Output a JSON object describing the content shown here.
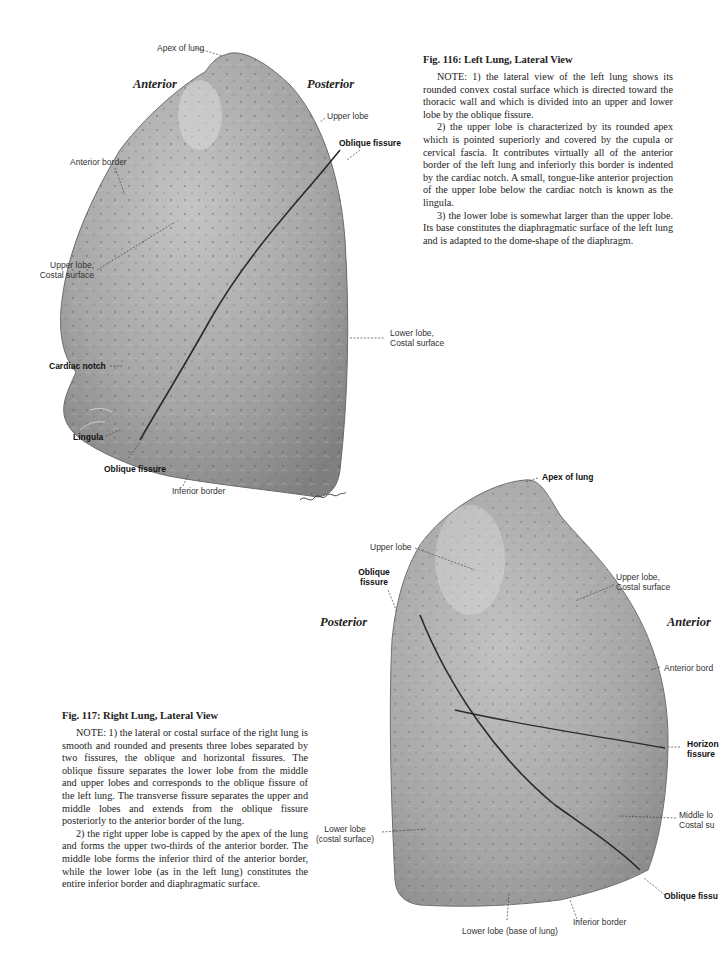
{
  "figure_116": {
    "title": "Fig. 116: Left Lung, Lateral View",
    "paragraphs": [
      "NOTE: 1) the lateral view of the left lung shows its rounded convex costal surface which is directed toward the thoracic wall and which is divided into an upper and lower lobe by the oblique fissure.",
      "2) the upper lobe is characterized by its rounded apex which is pointed superiorly and covered by the cupula or cervical fascia. It contributes virtually all of the anterior border of the left lung and inferiorly this border is indented by the cardiac notch. A small, tongue-like anterior projection of the upper lobe below the cardiac notch is known as the lingula.",
      "3) the lower lobe is somewhat larger than the upper lobe. Its base constitutes the diaphragmatic surface of the left lung and is adapted to the dome-shape of the diaphragm."
    ],
    "directions": {
      "anterior": "Anterior",
      "posterior": "Posterior"
    },
    "labels": {
      "apex": "Apex of lung",
      "upper_lobe": "Upper lobe",
      "oblique_fissure_top": "Oblique fissure",
      "anterior_border": "Anterior border",
      "upper_lobe_costal_1": "Upper lobe,",
      "upper_lobe_costal_2": "Costal surface",
      "lower_lobe_costal_1": "Lower lobe,",
      "lower_lobe_costal_2": "Costal surface",
      "cardiac_notch": "Cardiac notch",
      "lingula": "Lingula",
      "oblique_fissure_bottom": "Oblique fissure",
      "inferior_border": "Inferior border"
    },
    "signature": "Lipniers"
  },
  "figure_117": {
    "title": "Fig. 117: Right Lung, Lateral View",
    "paragraphs": [
      "NOTE: 1) the lateral or costal surface of the right lung is smooth and rounded and presents three lobes separated by two fissures, the oblique and horizontal fissures. The oblique fissure separates the lower lobe from the middle and upper lobes and corresponds to the oblique fissure of the left lung. The transverse fissure separates the upper and middle lobes and extends from the oblique fissure posteriorly to the anterior border of the lung.",
      "2) the right upper lobe is capped by the apex of the lung and forms the upper two-thirds of the anterior border. The middle lobe forms the inferior third of the anterior border, while the lower lobe (as in the left lung) constitutes the entire inferior border and diaphragmatic surface."
    ],
    "directions": {
      "posterior": "Posterior",
      "anterior": "Anterior"
    },
    "labels": {
      "apex": "Apex of lung",
      "upper_lobe": "Upper lobe",
      "oblique_fissure_1": "Oblique",
      "oblique_fissure_2": "fissure",
      "upper_lobe_costal_1": "Upper lobe,",
      "upper_lobe_costal_2": "Costal surface",
      "anterior_border": "Anterior bord",
      "horizontal_fissure_1": "Horizon",
      "horizontal_fissure_2": "fissure",
      "middle_lobe_costal_1": "Middle lo",
      "middle_lobe_costal_2": "Costal su",
      "lower_lobe_costal_1": "Lower lobe",
      "lower_lobe_costal_2": "(costal surface)",
      "oblique_fissure_bottom": "Oblique fissu",
      "inferior_border": "Inferior border",
      "lower_lobe_base": "Lower lobe (base of lung)"
    }
  }
}
